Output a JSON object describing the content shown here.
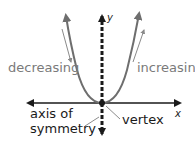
{
  "diagram": {
    "labels": {
      "decreasing": "decreasing",
      "increasing": "increasing",
      "axis_of_symmetry_line1": "axis of",
      "axis_of_symmetry_line2": "symmetry",
      "vertex": "vertex",
      "x_axis": "x",
      "y_axis": "y"
    },
    "colors": {
      "curve": "#6e6e6e",
      "axes": "#1a1a1a",
      "direction_arrows": "#8a8a8a",
      "gray_text": "#7a7a7a",
      "black_text": "#1a1a1a"
    }
  }
}
